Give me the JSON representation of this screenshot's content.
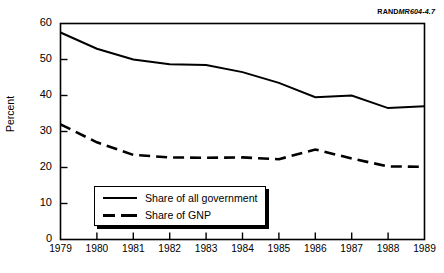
{
  "figure": {
    "source_tag_brand": "RAND",
    "source_tag_code": "MR604-4.7"
  },
  "chart_data": {
    "type": "line",
    "title": "",
    "xlabel": "",
    "ylabel": "Percent",
    "categories": [
      "1979",
      "1980",
      "1981",
      "1982",
      "1983",
      "1984",
      "1985",
      "1986",
      "1987",
      "1988",
      "1989"
    ],
    "x": [
      1979,
      1980,
      1981,
      1982,
      1983,
      1984,
      1985,
      1986,
      1987,
      1988,
      1989
    ],
    "xlim": [
      1979,
      1989
    ],
    "ylim": [
      0,
      60
    ],
    "yticks": [
      0,
      10,
      20,
      30,
      40,
      50,
      60
    ],
    "ytick_labels": [
      "0",
      "10",
      "20",
      "30",
      "40",
      "50",
      "60"
    ],
    "grid": false,
    "legend_position": "lower-left-inside",
    "series": [
      {
        "name": "Share of all government",
        "style": "solid",
        "color": "#000000",
        "values": [
          57.5,
          53.0,
          50.0,
          48.7,
          48.5,
          46.5,
          43.5,
          39.5,
          40.0,
          36.5,
          37.0
        ]
      },
      {
        "name": "Share of GNP",
        "style": "dashed",
        "color": "#000000",
        "values": [
          32.0,
          27.0,
          23.5,
          22.8,
          22.7,
          22.8,
          22.3,
          25.0,
          22.5,
          20.3,
          20.2
        ]
      }
    ]
  },
  "legend": {
    "items": [
      {
        "label": "Share of all government",
        "style": "solid"
      },
      {
        "label": "Share of GNP",
        "style": "dashed"
      }
    ]
  }
}
